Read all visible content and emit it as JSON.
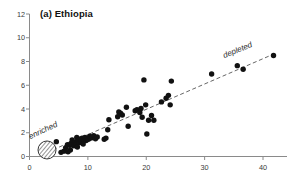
{
  "figure": {
    "panel_label": "(a) Ethiopia",
    "background": "#ffffff",
    "point_color": "#111111",
    "axis_color": "#8a8a8a",
    "trend_color": "#555555"
  },
  "annotations": {
    "enriched": "enriched",
    "depleted": "depleted"
  },
  "axes": {
    "x_ticks": [
      "0",
      "10",
      "20",
      "30",
      "40"
    ],
    "y_ticks": [
      "0",
      "2",
      "4",
      "6",
      "8",
      "10",
      "12"
    ]
  },
  "chart_data": {
    "type": "scatter",
    "title": "(a) Ethiopia",
    "xlabel": "",
    "ylabel": "",
    "xlim": [
      0,
      44
    ],
    "ylim": [
      0,
      12
    ],
    "grid": false,
    "legend": null,
    "x_ticks": [
      0,
      10,
      20,
      30,
      40
    ],
    "y_ticks": [
      0,
      2,
      4,
      6,
      8,
      10,
      12
    ],
    "annotations": [
      {
        "text": "enriched",
        "x": 3.0,
        "y": 1.9,
        "rotation": -25,
        "style": "italic"
      },
      {
        "text": "depleted",
        "x": 34.0,
        "y": 8.6,
        "rotation": -22,
        "style": "italic"
      }
    ],
    "marker": {
      "shape": "circle",
      "color": "#111111",
      "size": 4.2
    },
    "special_marker": {
      "shape": "hatched-circle",
      "x": 3.0,
      "y": 0.55,
      "radius_px": 9,
      "note": "diagonally hatched open circle at lower-left"
    },
    "trendline": {
      "style": "dashed",
      "color": "#555555",
      "x": [
        3.0,
        41.0
      ],
      "y": [
        0.35,
        8.45
      ]
    },
    "points": [
      {
        "x": 4.6,
        "y": 1.25
      },
      {
        "x": 5.4,
        "y": 0.35
      },
      {
        "x": 5.9,
        "y": 0.45
      },
      {
        "x": 6.2,
        "y": 0.75
      },
      {
        "x": 6.5,
        "y": 1.0
      },
      {
        "x": 6.9,
        "y": 0.95
      },
      {
        "x": 7.1,
        "y": 1.1
      },
      {
        "x": 7.3,
        "y": 1.4
      },
      {
        "x": 7.6,
        "y": 0.9
      },
      {
        "x": 7.8,
        "y": 1.2
      },
      {
        "x": 8.0,
        "y": 1.05
      },
      {
        "x": 8.1,
        "y": 1.6
      },
      {
        "x": 8.3,
        "y": 1.35
      },
      {
        "x": 8.5,
        "y": 1.15
      },
      {
        "x": 8.6,
        "y": 1.45
      },
      {
        "x": 8.8,
        "y": 1.3
      },
      {
        "x": 9.0,
        "y": 1.55
      },
      {
        "x": 9.1,
        "y": 1.2
      },
      {
        "x": 9.3,
        "y": 1.4
      },
      {
        "x": 9.5,
        "y": 1.6
      },
      {
        "x": 9.7,
        "y": 1.35
      },
      {
        "x": 9.9,
        "y": 1.5
      },
      {
        "x": 10.1,
        "y": 1.45
      },
      {
        "x": 10.3,
        "y": 1.7
      },
      {
        "x": 10.5,
        "y": 1.55
      },
      {
        "x": 10.8,
        "y": 1.6
      },
      {
        "x": 11.0,
        "y": 1.75
      },
      {
        "x": 11.3,
        "y": 1.5
      },
      {
        "x": 11.6,
        "y": 1.65
      },
      {
        "x": 9.2,
        "y": 1.05
      },
      {
        "x": 8.2,
        "y": 0.8
      },
      {
        "x": 7.0,
        "y": 0.55
      },
      {
        "x": 6.6,
        "y": 0.4
      },
      {
        "x": 12.8,
        "y": 1.45
      },
      {
        "x": 13.4,
        "y": 2.25
      },
      {
        "x": 13.6,
        "y": 3.1
      },
      {
        "x": 13.1,
        "y": 1.55
      },
      {
        "x": 15.1,
        "y": 3.35
      },
      {
        "x": 15.3,
        "y": 3.75
      },
      {
        "x": 15.6,
        "y": 3.65
      },
      {
        "x": 15.9,
        "y": 3.5
      },
      {
        "x": 16.6,
        "y": 4.15
      },
      {
        "x": 16.9,
        "y": 2.55
      },
      {
        "x": 18.1,
        "y": 3.85
      },
      {
        "x": 18.4,
        "y": 3.95
      },
      {
        "x": 18.9,
        "y": 3.7
      },
      {
        "x": 19.1,
        "y": 4.05
      },
      {
        "x": 19.3,
        "y": 3.3
      },
      {
        "x": 19.6,
        "y": 6.45
      },
      {
        "x": 19.9,
        "y": 4.35
      },
      {
        "x": 20.1,
        "y": 1.9
      },
      {
        "x": 20.4,
        "y": 3.05
      },
      {
        "x": 20.9,
        "y": 3.45
      },
      {
        "x": 21.3,
        "y": 3.05
      },
      {
        "x": 22.6,
        "y": 4.6
      },
      {
        "x": 23.4,
        "y": 4.9
      },
      {
        "x": 23.8,
        "y": 5.15
      },
      {
        "x": 24.1,
        "y": 4.35
      },
      {
        "x": 24.3,
        "y": 6.35
      },
      {
        "x": 31.2,
        "y": 6.95
      },
      {
        "x": 35.6,
        "y": 7.65
      },
      {
        "x": 36.6,
        "y": 7.35
      },
      {
        "x": 41.8,
        "y": 8.5
      }
    ]
  }
}
